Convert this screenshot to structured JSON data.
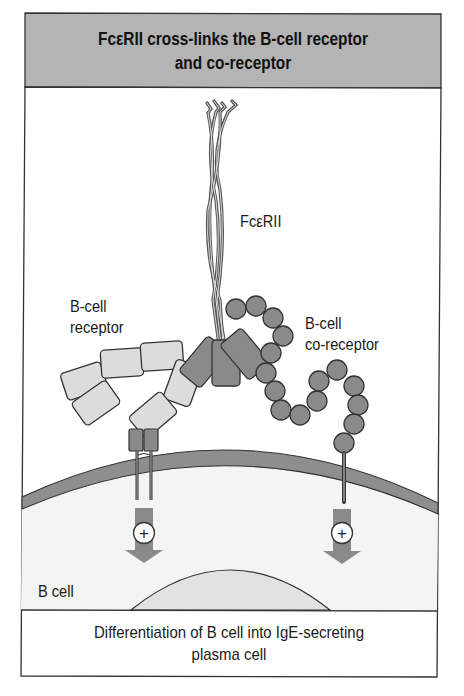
{
  "figure": {
    "title_line1": "FcεRII cross-links the B-cell receptor",
    "title_line2": "and co-receptor",
    "caption_line1": "Differentiation of B cell into IgE-secreting",
    "caption_line2": "plasma cell"
  },
  "labels": {
    "fcerii": "FcεRII",
    "bcr_line1": "B-cell",
    "bcr_line2": "receptor",
    "coreceptor_line1": "B-cell",
    "coreceptor_line2": "co-receptor",
    "b_cell": "B cell"
  },
  "signals": [
    {
      "name": "bcr-signal",
      "symbol": "+"
    },
    {
      "name": "coreceptor-signal",
      "symbol": "+"
    }
  ],
  "colors": {
    "header_fill": "#b4b4b4",
    "membrane": "#8e8e8e",
    "dark_protein": "#8a8a8a",
    "light_protein": "#dcdcdc",
    "cytoplasm": "#f4f4f4",
    "nucleus": "#e2e2e2",
    "arrow": "#8a8a8a",
    "outline": "#333333"
  }
}
